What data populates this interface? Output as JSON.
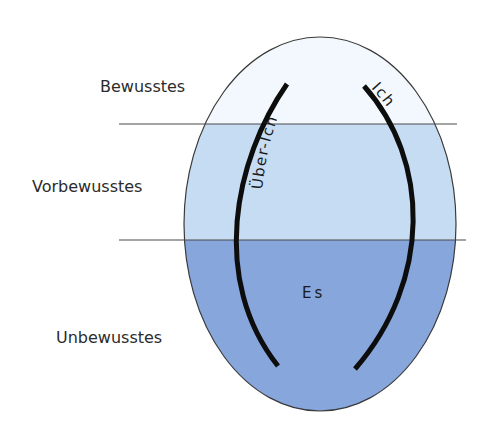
{
  "diagram": {
    "type": "freud-structural-model",
    "colors": {
      "conscious_band": "#f2f8fd",
      "preconscious_band": "#c6dcf3",
      "unconscious_band": "#87a6dc",
      "outline": "#3a3a3a",
      "arc_stroke": "#0d0d0d",
      "divider": "#4a4a4a",
      "text": "#2b2b2b"
    },
    "levels": [
      {
        "id": "conscious",
        "label": "Bewusstes"
      },
      {
        "id": "preconscious",
        "label": "Vorbewusstes"
      },
      {
        "id": "unconscious",
        "label": "Unbewusstes"
      }
    ],
    "instances": {
      "superego": "Über-Ich",
      "ego": "Ich",
      "id": "Es"
    }
  }
}
